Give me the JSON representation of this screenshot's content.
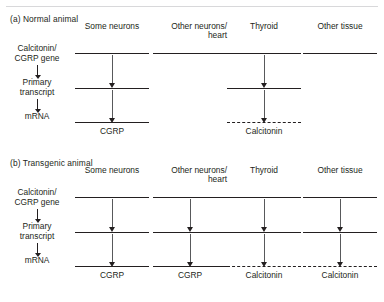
{
  "figure": {
    "stages": {
      "gene": "Calcitonin/\nCGRP gene",
      "transcript": "Primary\ntranscript",
      "mrna": "mRNA"
    }
  },
  "panels": [
    {
      "id": "a",
      "title": "(a) Normal animal",
      "columns": [
        {
          "header": "Some neurons",
          "gene": true,
          "transcript": true,
          "mrna": true,
          "mrna_style": "solid",
          "product": "CGRP"
        },
        {
          "header": "Other neurons/\nheart",
          "gene": true,
          "transcript": false,
          "mrna": false,
          "mrna_style": "none",
          "product": ""
        },
        {
          "header": "Thyroid",
          "gene": true,
          "transcript": true,
          "mrna": true,
          "mrna_style": "dashed",
          "product": "Calcitonin"
        },
        {
          "header": "Other tissue",
          "gene": true,
          "transcript": false,
          "mrna": false,
          "mrna_style": "none",
          "product": ""
        }
      ]
    },
    {
      "id": "b",
      "title": "(b) Transgenic animal",
      "columns": [
        {
          "header": "Some neurons",
          "gene": true,
          "transcript": true,
          "mrna": true,
          "mrna_style": "solid",
          "product": "CGRP"
        },
        {
          "header": "Other neurons/\nheart",
          "gene": true,
          "transcript": true,
          "mrna": true,
          "mrna_style": "solid",
          "product": "CGRP"
        },
        {
          "header": "Thyroid",
          "gene": true,
          "transcript": true,
          "mrna": true,
          "mrna_style": "dashed",
          "product": "Calcitonin"
        },
        {
          "header": "Other tissue",
          "gene": true,
          "transcript": true,
          "mrna": true,
          "mrna_style": "dashed",
          "product": "Calcitonin"
        }
      ]
    }
  ],
  "colors": {
    "ink": "#231f20",
    "arrow": "#58595b",
    "rule": "#d8d8da"
  }
}
